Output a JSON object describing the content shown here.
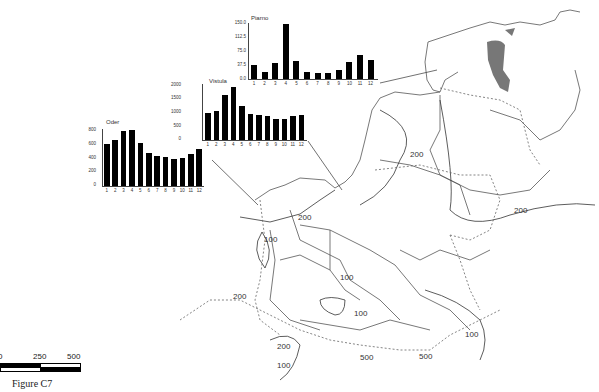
{
  "figure_caption": "Figure C7",
  "scale_bar": {
    "labels": [
      "0",
      "250",
      "500 km"
    ]
  },
  "isoline_labels": [
    {
      "text": "200",
      "x": 298,
      "y": 213
    },
    {
      "text": "100",
      "x": 264,
      "y": 235
    },
    {
      "text": "200",
      "x": 410,
      "y": 150
    },
    {
      "text": "200",
      "x": 514,
      "y": 206
    },
    {
      "text": "100",
      "x": 340,
      "y": 273
    },
    {
      "text": "200",
      "x": 233,
      "y": 292
    },
    {
      "text": "100",
      "x": 354,
      "y": 309
    },
    {
      "text": "200",
      "x": 277,
      "y": 342
    },
    {
      "text": "100",
      "x": 277,
      "y": 361
    },
    {
      "text": "500",
      "x": 360,
      "y": 353
    },
    {
      "text": "500",
      "x": 419,
      "y": 352
    },
    {
      "text": "100",
      "x": 465,
      "y": 330
    }
  ],
  "chart_data": [
    {
      "type": "bar",
      "title": "Oder",
      "categories": [
        "1",
        "2",
        "3",
        "4",
        "5",
        "6",
        "7",
        "8",
        "9",
        "10",
        "11",
        "12"
      ],
      "values": [
        590,
        640,
        770,
        790,
        600,
        470,
        420,
        405,
        385,
        390,
        455,
        525
      ],
      "yticks": [
        "0",
        "200",
        "400",
        "600",
        "800"
      ],
      "ylim": [
        0,
        800
      ],
      "xlabel": "",
      "ylabel": ""
    },
    {
      "type": "bar",
      "title": "Vistula",
      "categories": [
        "1",
        "2",
        "3",
        "4",
        "5",
        "6",
        "7",
        "8",
        "9",
        "10",
        "11",
        "12"
      ],
      "values": [
        950,
        1050,
        1600,
        1900,
        1200,
        920,
        880,
        860,
        740,
        750,
        860,
        900
      ],
      "yticks": [
        "0",
        "500",
        "1000",
        "1500",
        "2000"
      ],
      "ylim": [
        0,
        2000
      ],
      "xlabel": "",
      "ylabel": ""
    },
    {
      "type": "bar",
      "title": "Piarno",
      "categories": [
        "1",
        "2",
        "3",
        "4",
        "5",
        "6",
        "7",
        "8",
        "9",
        "10",
        "11",
        "12"
      ],
      "values": [
        38,
        20,
        43,
        148,
        48,
        18,
        16,
        15,
        24,
        46,
        65,
        51
      ],
      "yticks": [
        "0.0",
        "37.5",
        "75.0",
        "112.5",
        "150.0"
      ],
      "ylim": [
        0,
        150
      ],
      "xlabel": "",
      "ylabel": ""
    }
  ]
}
